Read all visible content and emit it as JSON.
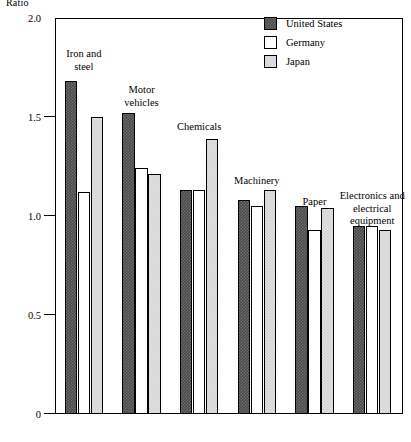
{
  "chart_data": {
    "type": "bar",
    "title": "",
    "xlabel": "",
    "ylabel": "Ratio",
    "ylim": [
      0,
      2.0
    ],
    "yticks": [
      "0",
      "0.5",
      "1.0",
      "1.5",
      "2.0"
    ],
    "ytick_values": [
      0,
      0.5,
      1.0,
      1.5,
      2.0
    ],
    "grid": false,
    "legend_position": "top-right",
    "categories": [
      "Iron and\nsteel",
      "Motor\nvehicles",
      "Chemicals",
      "Machinery",
      "Paper",
      "Electronics and\nelectrical\nequipment"
    ],
    "series": [
      {
        "name": "United States",
        "color": "#4a4a4a",
        "values": [
          1.68,
          1.52,
          1.13,
          1.08,
          1.05,
          0.95
        ]
      },
      {
        "name": "Germany",
        "color": "#ffffff",
        "values": [
          1.12,
          1.24,
          1.13,
          1.05,
          0.93,
          0.95
        ]
      },
      {
        "name": "Japan",
        "color": "#e2e2e2",
        "values": [
          1.5,
          1.21,
          1.39,
          1.13,
          1.04,
          0.93
        ]
      }
    ]
  },
  "legend": {
    "items": [
      {
        "label": "United States"
      },
      {
        "label": "Germany"
      },
      {
        "label": "Japan"
      }
    ]
  }
}
